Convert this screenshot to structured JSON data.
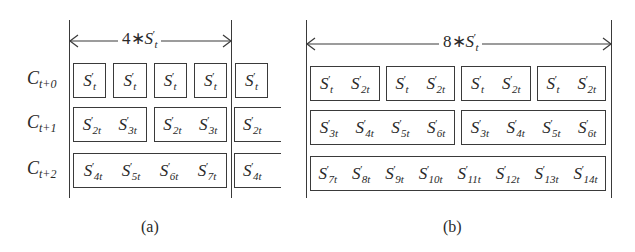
{
  "panel_a": {
    "span_label": {
      "coef": "4",
      "op": "∗",
      "base": "S",
      "prime": "′",
      "sub": "t"
    },
    "caption": "(a)",
    "rows": [
      {
        "label": {
          "base": "C",
          "sub": "t+0"
        },
        "boxes": [
          [
            "S′|t"
          ],
          [
            "S′|t"
          ],
          [
            "S′|t"
          ],
          [
            "S′|t"
          ]
        ],
        "overflow": [
          "S′|t"
        ]
      },
      {
        "label": {
          "base": "C",
          "sub": "t+1"
        },
        "boxes": [
          [
            "S′|2t",
            "S′|3t"
          ],
          [
            "S′|2t",
            "S′|3t"
          ]
        ],
        "overflow": [
          "S′|2t"
        ]
      },
      {
        "label": {
          "base": "C",
          "sub": "t+2"
        },
        "boxes": [
          [
            "S′|4t",
            "S′|5t",
            "S′|6t",
            "S′|7t"
          ]
        ],
        "overflow": [
          "S′|4t"
        ]
      }
    ]
  },
  "panel_b": {
    "span_label": {
      "coef": "8",
      "op": "∗",
      "base": "S",
      "prime": "′",
      "sub": "t"
    },
    "caption": "(b)",
    "rows": [
      {
        "boxes": [
          [
            "S′|t",
            "S′|2t"
          ],
          [
            "S′|t",
            "S′|2t"
          ],
          [
            "S′|t",
            "S′|2t"
          ],
          [
            "S′|t",
            "S′|2t"
          ]
        ]
      },
      {
        "boxes": [
          [
            "S′|3t",
            "S′|4t",
            "S′|5t",
            "S′|6t"
          ],
          [
            "S′|3t",
            "S′|4t",
            "S′|5t",
            "S′|6t"
          ]
        ]
      },
      {
        "boxes": [
          [
            "S′|7t",
            "S′|8t",
            "S′|9t",
            "S′|10t",
            "S′|11t",
            "S′|12t",
            "S′|13t",
            "S′|14t"
          ]
        ]
      }
    ]
  },
  "colors": {
    "line": "#3a3a3a",
    "text": "#2a2a2a",
    "background": "#ffffff"
  }
}
